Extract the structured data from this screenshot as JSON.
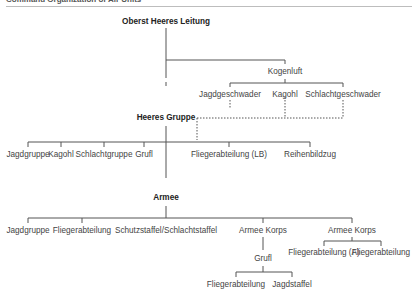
{
  "header": {
    "title": "Command Organization of Air Units"
  },
  "nodes": {
    "ohl": "Oberst Heeres Leitung",
    "kogenluft": "Kogenluft",
    "jagdgeschwader": "Jagdgeschwader",
    "kagohl_top": "Kagohl",
    "schlachtgeschwader": "Schlachtgeschwader",
    "heeres_gruppe": "Heeres Gruppe",
    "hg_jagdgruppe": "Jagdgruppe",
    "hg_kagohl": "Kagohl",
    "hg_schlachtgruppe": "Schlachtgruppe",
    "hg_grufl": "Grufl",
    "hg_fliegerabteilung_lb": "Fliegerabteilung (LB)",
    "hg_reihenbildzug": "Reihenbildzug",
    "armee": "Armee",
    "a_jagdgruppe": "Jagdgruppe",
    "a_fliegerabteilung": "Fliegerabteilung",
    "a_schutzstaffel": "Schutzstaffel/Schlachtstaffel",
    "armee_korps_1": "Armee Korps",
    "armee_korps_2": "Armee Korps",
    "ak1_grufl": "Grufl",
    "ak1_fliegerabteilung": "Fliegerabteilung",
    "ak1_jagdstaffel": "Jagdstaffel",
    "ak2_fliegerabteilung_a": "Fliegerabteilung (A)",
    "ak2_fliegerabteilung": "Fliegerabteilung"
  }
}
